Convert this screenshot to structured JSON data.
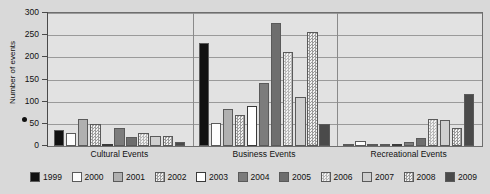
{
  "chart_data": {
    "type": "bar",
    "title": "",
    "xlabel": "",
    "ylabel": "Number of events",
    "ylim": [
      0,
      300
    ],
    "yticks": [
      "0",
      "50",
      "100",
      "150",
      "200",
      "250",
      "300"
    ],
    "grid": true,
    "legend_position": "bottom",
    "categories": [
      "Cultural Events",
      "Business Events",
      "Recreational Events"
    ],
    "series": [
      {
        "name": "1999",
        "color": "#111111",
        "pattern": "solid",
        "values": [
          35,
          232,
          0
        ]
      },
      {
        "name": "2000",
        "color": "#fdfdfd",
        "pattern": "solid",
        "values": [
          29,
          52,
          12
        ]
      },
      {
        "name": "2001",
        "color": "#b0b0b0",
        "pattern": "solid",
        "values": [
          62,
          83,
          0
        ]
      },
      {
        "name": "2002",
        "color": "#9e9e9e",
        "pattern": "checker",
        "values": [
          50,
          70,
          0
        ]
      },
      {
        "name": "2003",
        "color": "#ffffff",
        "pattern": "outline",
        "values": [
          0,
          90,
          5
        ]
      },
      {
        "name": "2004",
        "color": "#7c7c7c",
        "pattern": "solid",
        "values": [
          40,
          142,
          8
        ]
      },
      {
        "name": "2005",
        "color": "#6e6e6e",
        "pattern": "solid",
        "values": [
          20,
          278,
          17
        ]
      },
      {
        "name": "2006",
        "color": "#b8b8b8",
        "pattern": "checker",
        "values": [
          30,
          212,
          60
        ]
      },
      {
        "name": "2007",
        "color": "#cfcfcf",
        "pattern": "solid",
        "values": [
          23,
          110,
          58
        ]
      },
      {
        "name": "2008",
        "color": "#9b9b9b",
        "pattern": "checker",
        "values": [
          22,
          257,
          40
        ]
      },
      {
        "name": "2009",
        "color": "#4a4a4a",
        "pattern": "solid",
        "values": [
          10,
          50,
          117
        ]
      }
    ]
  },
  "axis": {
    "y_title": "Number of events"
  },
  "legend": {
    "items": [
      {
        "label": "1999"
      },
      {
        "label": "2000"
      },
      {
        "label": "2001"
      },
      {
        "label": "2002"
      },
      {
        "label": "2003"
      },
      {
        "label": "2004"
      },
      {
        "label": "2005"
      },
      {
        "label": "2006"
      },
      {
        "label": "2007"
      },
      {
        "label": "2008"
      },
      {
        "label": "2009"
      }
    ]
  }
}
